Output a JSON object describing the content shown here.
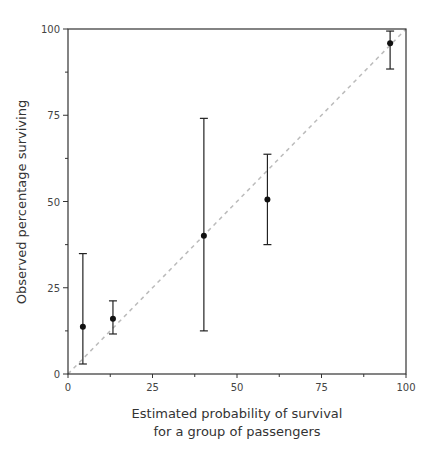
{
  "chart_data": {
    "type": "scatter",
    "title": "",
    "xlabel": "Estimated probability of survival for a group of passengers",
    "xlabel_lines": [
      "Estimated probability of survival",
      "for a group of passengers"
    ],
    "ylabel": "Observed percentage surviving",
    "xlim": [
      0,
      100
    ],
    "ylim": [
      0,
      100
    ],
    "x_ticks": [
      0,
      25,
      50,
      75,
      100
    ],
    "y_ticks": [
      0,
      25,
      50,
      75,
      100
    ],
    "grid": false,
    "reference_line": {
      "type": "diagonal",
      "from": [
        0,
        0
      ],
      "to": [
        100,
        100
      ],
      "style": "dashed",
      "color": "#bbbbbb"
    },
    "series": [
      {
        "name": "groups",
        "points": [
          {
            "x": 4.4,
            "y": 13.7,
            "lower": 2.9,
            "upper": 34.9
          },
          {
            "x": 13.3,
            "y": 16.0,
            "lower": 11.6,
            "upper": 21.2
          },
          {
            "x": 40.2,
            "y": 40.1,
            "lower": 12.5,
            "upper": 74.1
          },
          {
            "x": 59.0,
            "y": 50.6,
            "lower": 37.5,
            "upper": 63.7
          },
          {
            "x": 95.3,
            "y": 95.9,
            "lower": 88.4,
            "upper": 99.4
          }
        ]
      }
    ]
  }
}
